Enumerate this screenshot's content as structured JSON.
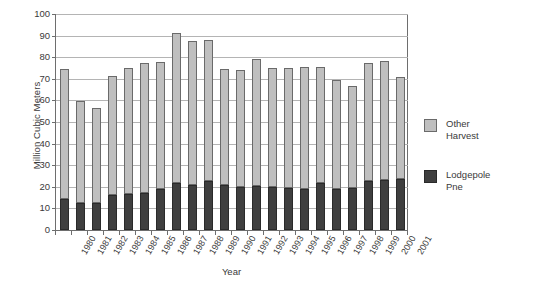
{
  "chart_data": {
    "type": "bar",
    "stacked": true,
    "title": "",
    "xlabel": "Year",
    "ylabel": "Million Cubic Meters",
    "ylim": [
      0,
      100
    ],
    "ytick_step": 10,
    "yticks": [
      0,
      10,
      20,
      30,
      40,
      50,
      60,
      70,
      80,
      90,
      100
    ],
    "grid": true,
    "legend_position": "right",
    "categories": [
      "1980",
      "1981",
      "1982",
      "1983",
      "1984",
      "1985",
      "1986",
      "1987",
      "1988",
      "1989",
      "1990",
      "1991",
      "1992",
      "1993",
      "1994",
      "1995",
      "1996",
      "1997",
      "1998",
      "1999",
      "2000",
      "2001"
    ],
    "series": [
      {
        "name": "Lodgepole Pine",
        "color": "#3f3f3f",
        "values": [
          14.5,
          12.6,
          12.3,
          16.0,
          16.5,
          17.3,
          19.0,
          21.8,
          21.0,
          22.6,
          20.7,
          19.8,
          20.5,
          19.9,
          19.3,
          18.8,
          21.6,
          19.2,
          19.4,
          22.9,
          23.1,
          23.4
        ]
      },
      {
        "name": "Other Harvest",
        "color": "#bfbfbf",
        "values": [
          60.2,
          47.1,
          44.2,
          55.4,
          58.5,
          60.1,
          58.6,
          69.3,
          66.5,
          65.6,
          53.7,
          54.5,
          58.9,
          55.3,
          55.9,
          56.7,
          53.7,
          50.4,
          47.3,
          54.2,
          55.3,
          47.3
        ]
      }
    ],
    "totals": [
      74.7,
      59.7,
      56.5,
      71.4,
      75.0,
      77.4,
      77.6,
      91.1,
      87.5,
      88.2,
      74.4,
      74.3,
      79.4,
      75.2,
      75.2,
      75.5,
      75.3,
      69.6,
      66.7,
      77.1,
      78.4,
      70.7
    ]
  },
  "legend": {
    "entries": [
      {
        "label_line1": "Other",
        "label_line2": "Harvest"
      },
      {
        "label_line1": "Lodgepole",
        "label_line2": "Pne"
      }
    ]
  },
  "axes": {
    "y_title": "Million Cubic Meters",
    "x_title": "Year"
  },
  "colors": {
    "other_harvest": "#bfbfbf",
    "lodgepole_pine": "#3f3f3f",
    "gridline": "#b4b4b4",
    "axis": "#6e6e6e",
    "text": "#3a3a3a",
    "background": "#ffffff"
  }
}
